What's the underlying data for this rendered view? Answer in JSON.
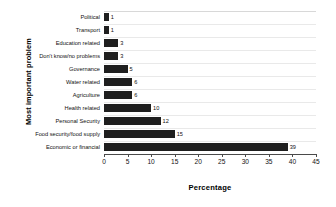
{
  "chart_data": {
    "type": "bar",
    "orientation": "horizontal",
    "title": "",
    "xlabel": "Percentage",
    "ylabel": "Most important problem",
    "xlim": [
      0,
      45
    ],
    "xticks": [
      0,
      5,
      10,
      15,
      20,
      25,
      30,
      35,
      40,
      45
    ],
    "grid": true,
    "legend": null,
    "bar_color": "#1f1f1f",
    "categories": [
      "Political",
      "Transport",
      "Education related",
      "Don't know/no problems",
      "Governance",
      "Water  related",
      "Agriculture",
      "Health related",
      "Personal Security",
      "Food security/food supply",
      "Economic or financial"
    ],
    "values": [
      1,
      1,
      3,
      3,
      5,
      6,
      6,
      10,
      12,
      15,
      39
    ],
    "data_labels": [
      "1",
      "1",
      "3",
      "3",
      "5",
      "6",
      "6",
      "10",
      "12",
      "15",
      "39"
    ]
  }
}
